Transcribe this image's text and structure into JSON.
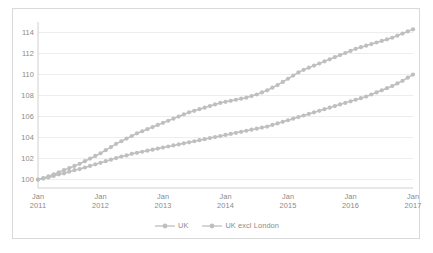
{
  "chart_data": {
    "type": "line",
    "title": "",
    "xlabel": "",
    "ylabel": "",
    "ylim": [
      99.2,
      115.0
    ],
    "yticks": [
      100,
      102,
      104,
      106,
      108,
      110,
      112,
      114
    ],
    "ytick_labels": [
      "100",
      "102",
      "104",
      "106",
      "108",
      "110",
      "112",
      "114"
    ],
    "grid": true,
    "grid_axis": "y",
    "legend_position": "bottom-center",
    "marker": "circle",
    "x_tick_labels": [
      {
        "month": "Jan",
        "year": "2011"
      },
      {
        "month": "Jan",
        "year": "2012"
      },
      {
        "month": "Jan",
        "year": "2013"
      },
      {
        "month": "Jan",
        "year": "2014"
      },
      {
        "month": "Jan",
        "year": "2015"
      },
      {
        "month": "Jan",
        "year": "2016"
      },
      {
        "month": "Jan",
        "year": "2017"
      }
    ],
    "x": [
      "Jan 2011",
      "Feb 2011",
      "Mar 2011",
      "Apr 2011",
      "May 2011",
      "Jun 2011",
      "Jul 2011",
      "Aug 2011",
      "Sep 2011",
      "Oct 2011",
      "Nov 2011",
      "Dec 2011",
      "Jan 2012",
      "Feb 2012",
      "Mar 2012",
      "Apr 2012",
      "May 2012",
      "Jun 2012",
      "Jul 2012",
      "Aug 2012",
      "Sep 2012",
      "Oct 2012",
      "Nov 2012",
      "Dec 2012",
      "Jan 2013",
      "Feb 2013",
      "Mar 2013",
      "Apr 2013",
      "May 2013",
      "Jun 2013",
      "Jul 2013",
      "Aug 2013",
      "Sep 2013",
      "Oct 2013",
      "Nov 2013",
      "Dec 2013",
      "Jan 2014",
      "Feb 2014",
      "Mar 2014",
      "Apr 2014",
      "May 2014",
      "Jun 2014",
      "Jul 2014",
      "Aug 2014",
      "Sep 2014",
      "Oct 2014",
      "Nov 2014",
      "Dec 2014",
      "Jan 2015",
      "Feb 2015",
      "Mar 2015",
      "Apr 2015",
      "May 2015",
      "Jun 2015",
      "Jul 2015",
      "Aug 2015",
      "Sep 2015",
      "Oct 2015",
      "Nov 2015",
      "Dec 2015",
      "Jan 2016",
      "Feb 2016",
      "Mar 2016",
      "Apr 2016",
      "May 2016",
      "Jun 2016",
      "Jul 2016",
      "Aug 2016",
      "Sep 2016",
      "Oct 2016",
      "Nov 2016",
      "Dec 2016",
      "Jan 2017"
    ],
    "series": [
      {
        "name": "UK",
        "color": "#bfbfbf",
        "values": [
          100.0,
          100.15,
          100.3,
          100.5,
          100.7,
          100.9,
          101.1,
          101.3,
          101.5,
          101.75,
          102.0,
          102.25,
          102.5,
          102.8,
          103.1,
          103.4,
          103.65,
          103.9,
          104.15,
          104.4,
          104.6,
          104.8,
          105.0,
          105.2,
          105.4,
          105.6,
          105.8,
          106.0,
          106.2,
          106.4,
          106.55,
          106.7,
          106.85,
          107.0,
          107.15,
          107.3,
          107.4,
          107.5,
          107.6,
          107.7,
          107.8,
          107.95,
          108.1,
          108.3,
          108.5,
          108.75,
          109.0,
          109.3,
          109.6,
          109.9,
          110.2,
          110.45,
          110.65,
          110.85,
          111.05,
          111.25,
          111.45,
          111.65,
          111.85,
          112.05,
          112.25,
          112.45,
          112.6,
          112.75,
          112.9,
          113.05,
          113.2,
          113.35,
          113.5,
          113.7,
          113.9,
          114.1,
          114.3
        ]
      },
      {
        "name": "UK excl London",
        "color": "#bfbfbf",
        "values": [
          100.0,
          100.1,
          100.2,
          100.35,
          100.5,
          100.6,
          100.75,
          100.9,
          101.0,
          101.15,
          101.3,
          101.45,
          101.6,
          101.75,
          101.9,
          102.05,
          102.2,
          102.3,
          102.45,
          102.55,
          102.65,
          102.75,
          102.85,
          102.95,
          103.05,
          103.15,
          103.25,
          103.35,
          103.45,
          103.55,
          103.65,
          103.75,
          103.85,
          103.95,
          104.05,
          104.15,
          104.25,
          104.35,
          104.45,
          104.55,
          104.65,
          104.75,
          104.85,
          104.95,
          105.05,
          105.2,
          105.35,
          105.5,
          105.65,
          105.8,
          105.95,
          106.1,
          106.25,
          106.4,
          106.55,
          106.7,
          106.85,
          107.0,
          107.15,
          107.3,
          107.45,
          107.6,
          107.75,
          107.9,
          108.1,
          108.3,
          108.5,
          108.7,
          108.9,
          109.15,
          109.4,
          109.7,
          110.0
        ]
      }
    ]
  },
  "legend": {
    "items": [
      {
        "label": "UK"
      },
      {
        "label": "UK excl London"
      }
    ]
  },
  "colors": {
    "series_gray": "#bfbfbf",
    "grid": "#ededed",
    "axis": "#d0d0d0",
    "text": "#8a8a8a",
    "border": "#d9d9d9"
  }
}
